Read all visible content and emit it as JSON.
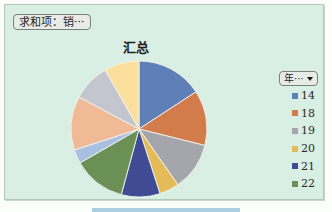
{
  "field_button": {
    "label": "求和项：销···"
  },
  "legend_button": {
    "label": "年···",
    "icon": "dropdown-caret-icon"
  },
  "colors": {
    "chart_background": "#d9efe3",
    "button_background": "#e8ece9",
    "bottom_bar": "#a9cfe0"
  },
  "chart_data": {
    "type": "pie",
    "title": "汇总",
    "categories": [
      "14",
      "18",
      "19",
      "20",
      "21",
      "22",
      "",
      "",
      "",
      ""
    ],
    "values": [
      15.8,
      13.1,
      11.4,
      4.7,
      9.2,
      12.5,
      3.3,
      12.8,
      8.9,
      8.3
    ],
    "value_unit": "percent of total (estimated from slice angles)",
    "colors": [
      "#5f7fb9",
      "#d27c4c",
      "#a4a6ab",
      "#e5bb5a",
      "#3f4c93",
      "#6a9056",
      "#a9c0e0",
      "#f0ba96",
      "#c3c6ce",
      "#fbdf9c"
    ],
    "start_angle_deg": 0,
    "direction": "clockwise",
    "legend": {
      "position": "right",
      "visible_entries": [
        "14",
        "18",
        "19",
        "20",
        "21",
        "22"
      ],
      "truncated": true
    }
  }
}
